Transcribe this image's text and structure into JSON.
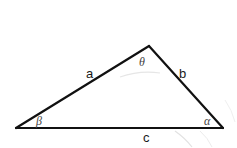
{
  "diagram": {
    "type": "triangle",
    "colors": {
      "edge": "#111111",
      "label": "#1a1a1a",
      "angle_label": "#444444",
      "artifact": "#e2e2e2",
      "background": "#ffffff"
    },
    "vertices": {
      "top": {
        "x": 149,
        "y": 46
      },
      "left": {
        "x": 16,
        "y": 128
      },
      "right": {
        "x": 223,
        "y": 128
      }
    },
    "sides": {
      "a": {
        "label": "a",
        "between": [
          "left",
          "top"
        ]
      },
      "b": {
        "label": "b",
        "between": [
          "top",
          "right"
        ]
      },
      "c": {
        "label": "c",
        "between": [
          "left",
          "right"
        ]
      }
    },
    "angles": {
      "theta": {
        "label": "θ",
        "vertex": "top"
      },
      "beta": {
        "label": "β",
        "vertex": "left"
      },
      "alpha": {
        "label": "α",
        "vertex": "right"
      }
    }
  }
}
